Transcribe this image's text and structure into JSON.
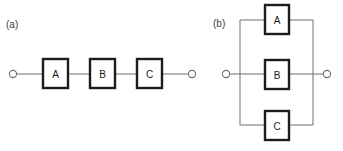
{
  "figure": {
    "title_visible": false,
    "background_color": "#ffffff",
    "wire_color": "#7a7a7a",
    "block_border_color": "#1c1c1c",
    "block_fill_color": "#ffffff",
    "terminal_color": "#6e6e6e",
    "label_color": "#3b3b3b"
  },
  "panels": [
    {
      "id": "a",
      "label": "(a)",
      "topology": "series",
      "label_pos": {
        "x": 6,
        "y": 28
      },
      "terminals": [
        {
          "name": "left-terminal",
          "cx": 13,
          "cy": 74,
          "r": 3.6
        },
        {
          "name": "right-terminal",
          "cx": 192,
          "cy": 74,
          "r": 3.6
        }
      ],
      "blocks": [
        {
          "label": "A",
          "x": 43,
          "y": 59,
          "w": 25,
          "h": 29
        },
        {
          "label": "B",
          "x": 90,
          "y": 59,
          "w": 25,
          "h": 29
        },
        {
          "label": "C",
          "x": 137,
          "y": 59,
          "w": 25,
          "h": 29
        }
      ],
      "wires": [
        {
          "name": "wire-terminal-to-a",
          "d": "M16.6 74 H43"
        },
        {
          "name": "wire-a-to-b",
          "d": "M68 74 H90"
        },
        {
          "name": "wire-b-to-c",
          "d": "M115 74 H137"
        },
        {
          "name": "wire-c-to-terminal",
          "d": "M162 74 H188.4"
        }
      ]
    },
    {
      "id": "b",
      "label": "(b)",
      "topology": "parallel",
      "label_pos": {
        "x": 213,
        "y": 27
      },
      "terminals": [
        {
          "name": "left-terminal",
          "cx": 226,
          "cy": 74,
          "r": 3.6
        },
        {
          "name": "right-terminal",
          "cx": 327,
          "cy": 74,
          "r": 3.6
        }
      ],
      "blocks": [
        {
          "label": "A",
          "x": 265,
          "y": 5,
          "w": 24,
          "h": 29
        },
        {
          "label": "B",
          "x": 265,
          "y": 60,
          "w": 24,
          "h": 29
        },
        {
          "label": "C",
          "x": 265,
          "y": 111,
          "w": 24,
          "h": 29
        }
      ],
      "wires": [
        {
          "name": "wire-left-terminal-to-bus",
          "d": "M229.6 74 H240"
        },
        {
          "name": "wire-left-bus-vertical",
          "d": "M240 20 V125"
        },
        {
          "name": "wire-right-bus-vertical",
          "d": "M313 20 V125"
        },
        {
          "name": "wire-bus-to-right-terminal",
          "d": "M313 74 H323.4"
        },
        {
          "name": "wire-top-branch-left",
          "d": "M240 20 H265"
        },
        {
          "name": "wire-top-branch-right",
          "d": "M289 20 H313"
        },
        {
          "name": "wire-middle-branch-left",
          "d": "M240 74 H265"
        },
        {
          "name": "wire-middle-branch-right",
          "d": "M289 74 H313"
        },
        {
          "name": "wire-bottom-branch-left",
          "d": "M240 125 H265"
        },
        {
          "name": "wire-bottom-branch-right",
          "d": "M289 125 H313"
        }
      ]
    }
  ]
}
